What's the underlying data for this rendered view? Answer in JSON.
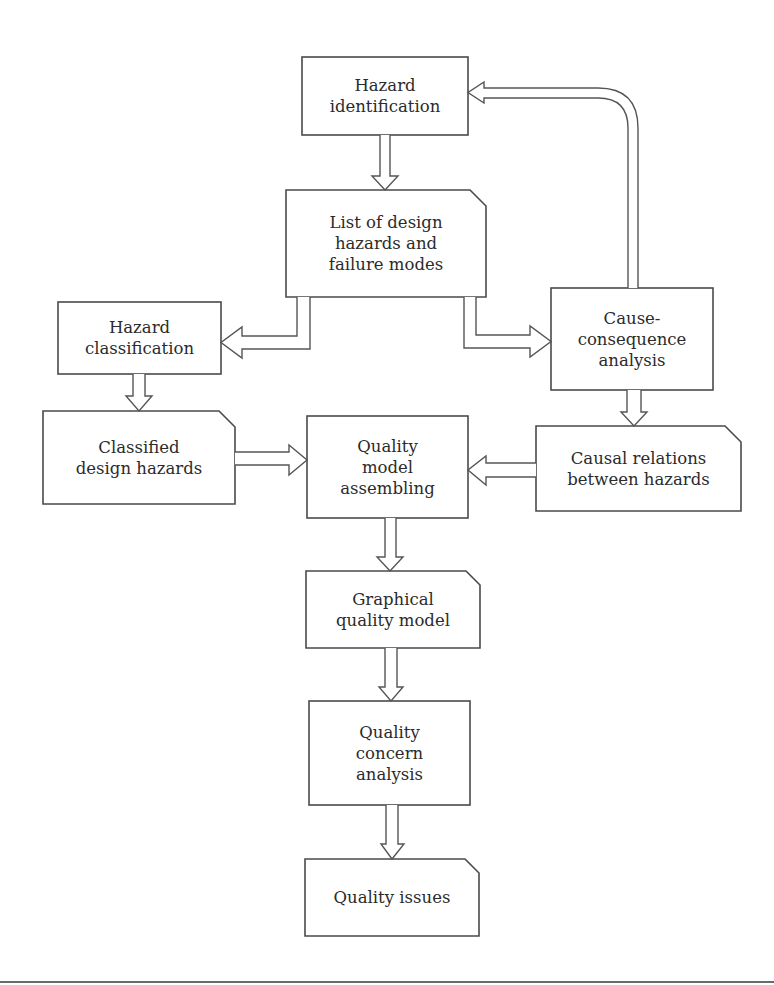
{
  "diagram": {
    "nodes": {
      "hazard_identification": {
        "label": "Hazard\nidentification",
        "kind": "process"
      },
      "design_hazards_list": {
        "label": "List of design\nhazards and\nfailure modes",
        "kind": "document"
      },
      "hazard_classification": {
        "label": "Hazard\nclassification",
        "kind": "process"
      },
      "cause_consequence_analysis": {
        "label": "Cause-\nconsequence\nanalysis",
        "kind": "process"
      },
      "classified_design_hazards": {
        "label": "Classified\ndesign hazards",
        "kind": "document"
      },
      "quality_model_assembling": {
        "label": "Quality\nmodel\nassembling",
        "kind": "process"
      },
      "causal_relations": {
        "label": "Causal relations\nbetween hazards",
        "kind": "document"
      },
      "graphical_quality_model": {
        "label": "Graphical\nquality model",
        "kind": "document"
      },
      "quality_concern_analysis": {
        "label": "Quality\nconcern\nanalysis",
        "kind": "process"
      },
      "quality_issues": {
        "label": "Quality issues",
        "kind": "document"
      }
    },
    "edges": [
      {
        "from": "hazard_identification",
        "to": "design_hazards_list"
      },
      {
        "from": "design_hazards_list",
        "to": "hazard_classification"
      },
      {
        "from": "design_hazards_list",
        "to": "cause_consequence_analysis"
      },
      {
        "from": "cause_consequence_analysis",
        "to": "hazard_identification"
      },
      {
        "from": "hazard_classification",
        "to": "classified_design_hazards"
      },
      {
        "from": "cause_consequence_analysis",
        "to": "causal_relations"
      },
      {
        "from": "classified_design_hazards",
        "to": "quality_model_assembling"
      },
      {
        "from": "causal_relations",
        "to": "quality_model_assembling"
      },
      {
        "from": "quality_model_assembling",
        "to": "graphical_quality_model"
      },
      {
        "from": "graphical_quality_model",
        "to": "quality_concern_analysis"
      },
      {
        "from": "quality_concern_analysis",
        "to": "quality_issues"
      }
    ]
  }
}
